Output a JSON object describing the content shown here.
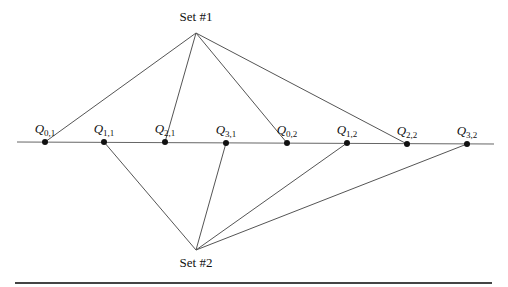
{
  "diagram": {
    "set1": {
      "label": "Set #1",
      "x": 196,
      "y": 33,
      "label_y": 10
    },
    "set2": {
      "label": "Set #2",
      "x": 196,
      "y": 250,
      "label_y": 256
    },
    "timeline": {
      "x1": 17,
      "y1": 142,
      "x2": 494,
      "y2": 144
    },
    "bottom_rule": {
      "x1": 15,
      "x2": 492,
      "y": 283
    },
    "points": [
      {
        "id": "q01",
        "name": "Q",
        "sub": "0,1",
        "x": 45,
        "y": 142,
        "set": 1
      },
      {
        "id": "q11",
        "name": "Q",
        "sub": "1,1",
        "x": 104,
        "y": 142,
        "set": 2
      },
      {
        "id": "q21",
        "name": "Q",
        "sub": "2,1",
        "x": 165,
        "y": 142,
        "set": 1
      },
      {
        "id": "q31",
        "name": "Q",
        "sub": "3,1",
        "x": 226,
        "y": 143,
        "set": 2
      },
      {
        "id": "q02",
        "name": "Q",
        "sub": "0,2",
        "x": 287,
        "y": 143,
        "set": 1
      },
      {
        "id": "q12",
        "name": "Q",
        "sub": "1,2",
        "x": 347,
        "y": 143,
        "set": 2
      },
      {
        "id": "q22",
        "name": "Q",
        "sub": "2,2",
        "x": 407,
        "y": 144,
        "set": 1
      },
      {
        "id": "q32",
        "name": "Q",
        "sub": "3,2",
        "x": 467,
        "y": 144,
        "set": 2
      }
    ]
  }
}
